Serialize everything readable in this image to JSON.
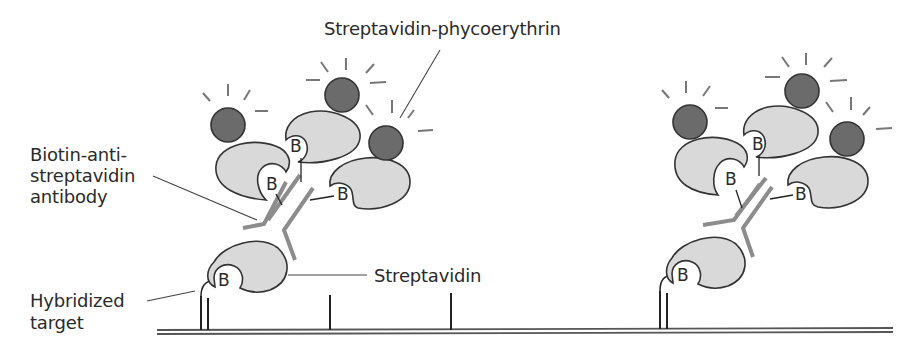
{
  "diagram": {
    "labels": {
      "streptavidin_phycoerythrin": "Streptavidin-phycoerythrin",
      "biotin_antibody_line1": "Biotin-anti-",
      "biotin_antibody_line2": "streptavidin",
      "biotin_antibody_line3": "antibody",
      "streptavidin": "Streptavidin",
      "hybridized_target_line1": "Hybridized",
      "hybridized_target_line2": "target"
    },
    "biotin_glyph": "B",
    "colors": {
      "streptavidin_fill": "#d9d9d9",
      "phycoerythrin_fill": "#6b6b6b",
      "antibody_stroke": "#8c8c8c",
      "outline": "#333333",
      "surface": "#555555"
    }
  }
}
